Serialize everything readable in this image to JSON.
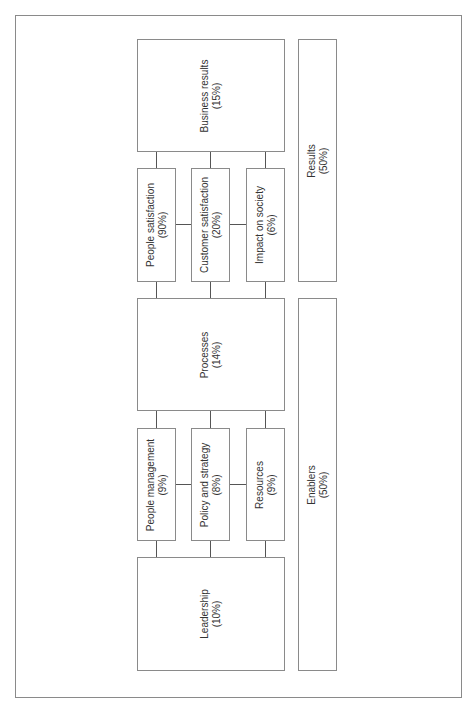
{
  "diagram": {
    "type": "EFQM excellence model (rotated)",
    "results_group": {
      "label": "Results",
      "value": "(50%)"
    },
    "enablers_group": {
      "label": "Enablers",
      "value": "(50%)"
    },
    "business_results": {
      "label": "Business results",
      "value": "(15%)"
    },
    "people_satisfaction": {
      "label": "People satisfaction",
      "value": "(90%)"
    },
    "customer_satisfaction": {
      "label": "Customer satisfaction",
      "value": "(20%)"
    },
    "impact_on_society": {
      "label": "Impact on society",
      "value": "(6%)"
    },
    "processes": {
      "label": "Processes",
      "value": "(14%)"
    },
    "people_management": {
      "label": "People management",
      "value": "(9%)"
    },
    "policy_and_strategy": {
      "label": "Policy and strategy",
      "value": "(8%)"
    },
    "resources": {
      "label": "Resources",
      "value": "(9%)"
    },
    "leadership": {
      "label": "Leadership",
      "value": "(10%)"
    }
  },
  "colors": {
    "border": "#8a8a8a",
    "connector": "#555555",
    "text": "#333333",
    "background": "#ffffff"
  }
}
